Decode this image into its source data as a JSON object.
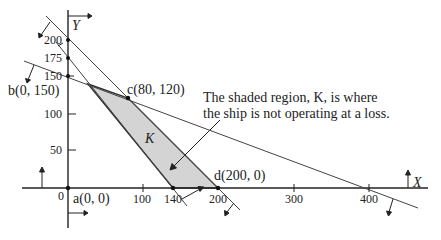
{
  "diagram": {
    "type": "linear-programming-feasible-region",
    "axes": {
      "x_label": "X",
      "y_label": "Y",
      "origin_label": "0",
      "x_ticks": [
        "100",
        "140",
        "200",
        "300",
        "400"
      ],
      "y_ticks": [
        "50",
        "100",
        "150",
        "175",
        "200"
      ]
    },
    "points": {
      "a": "a(0, 0)",
      "b": "b(0, 150)",
      "c": "c(80, 120)",
      "d": "d(200, 0)"
    },
    "region_label": "K",
    "annotation": {
      "line1": "The shaded region, K, is where",
      "line2": "the ship is not operating at a loss."
    },
    "colors": {
      "shade": "#d4d4d4",
      "line": "#333333",
      "background": "#ffffff"
    }
  }
}
